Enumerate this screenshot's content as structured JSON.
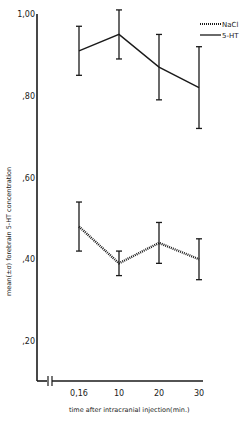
{
  "chart_data": {
    "type": "line",
    "title": "",
    "xlabel": "time after intracranial injection(min.)",
    "ylabel": "mean(±σ) forebrain 5-HT concentration",
    "categories": [
      "0.16",
      "10",
      "20",
      "30"
    ],
    "x_tick_labels": [
      "0,16",
      "10",
      "20",
      "30"
    ],
    "y_tick_labels": [
      "1,00",
      ",80",
      ",60",
      ",40",
      ",20"
    ],
    "y_ticks": [
      1.0,
      0.8,
      0.6,
      0.4,
      0.2
    ],
    "ylim": [
      0.1,
      1.0
    ],
    "grid": false,
    "legend_position": "top-right",
    "axis_break_x": true,
    "series": [
      {
        "name": "NaCl",
        "style": "dotted",
        "values": [
          0.48,
          0.39,
          0.44,
          0.4
        ],
        "error_low": [
          0.42,
          0.36,
          0.39,
          0.35
        ],
        "error_high": [
          0.54,
          0.42,
          0.49,
          0.45
        ]
      },
      {
        "name": "5-HT",
        "style": "solid",
        "values": [
          0.91,
          0.95,
          0.87,
          0.82
        ],
        "error_low": [
          0.85,
          0.89,
          0.79,
          0.72
        ],
        "error_high": [
          0.97,
          1.01,
          0.95,
          0.92
        ]
      }
    ]
  },
  "legend": {
    "items": [
      {
        "label": "NaCl",
        "style": "dotted"
      },
      {
        "label": "5-HT",
        "style": "solid"
      }
    ]
  },
  "colors": {
    "ink": "#1a1a1a",
    "background": "#ffffff"
  }
}
